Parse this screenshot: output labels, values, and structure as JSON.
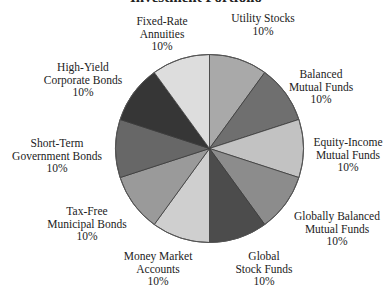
{
  "chart_data": {
    "type": "pie",
    "title": "Investment Portfolio",
    "start_angle": "12 o'clock",
    "direction": "clockwise",
    "slices": [
      {
        "label": "Utility Stocks",
        "lines": [
          "Utility Stocks"
        ],
        "value": 10,
        "pct_label": "10%",
        "color": "#a9a9a9"
      },
      {
        "label": "Balanced Mutual Funds",
        "lines": [
          "Balanced",
          "Mutual Funds"
        ],
        "value": 10,
        "pct_label": "10%",
        "color": "#6f6f6f"
      },
      {
        "label": "Equity-Income Mutual Funds",
        "lines": [
          "Equity-Income",
          "Mutual Funds"
        ],
        "value": 10,
        "pct_label": "10%",
        "color": "#c2c2c2"
      },
      {
        "label": "Globally Balanced Mutual Funds",
        "lines": [
          "Globally Balanced",
          "Mutual Funds"
        ],
        "value": 10,
        "pct_label": "10%",
        "color": "#8c8c8c"
      },
      {
        "label": "Global Stock Funds",
        "lines": [
          "Global",
          "Stock Funds"
        ],
        "value": 10,
        "pct_label": "10%",
        "color": "#4c4c4c"
      },
      {
        "label": "Money Market Accounts",
        "lines": [
          "Money Market",
          "Accounts"
        ],
        "value": 10,
        "pct_label": "10%",
        "color": "#cfcfcf"
      },
      {
        "label": "Tax-Free Municipal Bonds",
        "lines": [
          "Tax-Free",
          "Municipal Bonds"
        ],
        "value": 10,
        "pct_label": "10%",
        "color": "#9a9a9a"
      },
      {
        "label": "Short-Term Government Bonds",
        "lines": [
          "Short-Term",
          "Government Bonds"
        ],
        "value": 10,
        "pct_label": "10%",
        "color": "#676767"
      },
      {
        "label": "High-Yield Corporate Bonds",
        "lines": [
          "High-Yield",
          "Corporate Bonds"
        ],
        "value": 10,
        "pct_label": "10%",
        "color": "#363636"
      },
      {
        "label": "Fixed-Rate Annuities",
        "lines": [
          "Fixed-Rate",
          "Annuities"
        ],
        "value": 10,
        "pct_label": "10%",
        "color": "#dddddd"
      }
    ],
    "categories": [
      "Utility Stocks",
      "Balanced Mutual Funds",
      "Equity-Income Mutual Funds",
      "Globally Balanced Mutual Funds",
      "Global Stock Funds",
      "Money Market Accounts",
      "Tax-Free Municipal Bonds",
      "Short-Term Government Bonds",
      "High-Yield Corporate Bonds",
      "Fixed-Rate Annuities"
    ],
    "values": [
      10,
      10,
      10,
      10,
      10,
      10,
      10,
      10,
      10,
      10
    ],
    "legend": "none (labels placed around pie)"
  },
  "labels": [
    {
      "l1": "Utility Stocks",
      "l2": "",
      "pct": "10%"
    },
    {
      "l1": "Balanced",
      "l2": "Mutual Funds",
      "pct": "10%"
    },
    {
      "l1": "Equity-Income",
      "l2": "Mutual Funds",
      "pct": "10%"
    },
    {
      "l1": "Globally Balanced",
      "l2": "Mutual Funds",
      "pct": "10%"
    },
    {
      "l1": "Global",
      "l2": "Stock Funds",
      "pct": "10%"
    },
    {
      "l1": "Money Market",
      "l2": "Accounts",
      "pct": "10%"
    },
    {
      "l1": "Tax-Free",
      "l2": "Municipal Bonds",
      "pct": "10%"
    },
    {
      "l1": "Short-Term",
      "l2": "Government Bonds",
      "pct": "10%"
    },
    {
      "l1": "High-Yield",
      "l2": "Corporate Bonds",
      "pct": "10%"
    },
    {
      "l1": "Fixed-Rate",
      "l2": "Annuities",
      "pct": "10%"
    }
  ]
}
